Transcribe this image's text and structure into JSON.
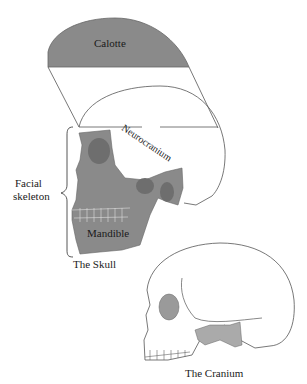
{
  "diagram": {
    "labels": {
      "calotte": "Calotte",
      "neurocranium": "Neurocranium",
      "facial_skeleton_line1": "Facial",
      "facial_skeleton_line2": "skeleton",
      "mandible": "Mandible",
      "skull_caption": "The Skull",
      "cranium_caption": "The Cranium"
    },
    "colors": {
      "shade": "#8a8a8a",
      "shade_dark": "#6e6e6e",
      "line": "#555555",
      "background": "#ffffff"
    }
  }
}
